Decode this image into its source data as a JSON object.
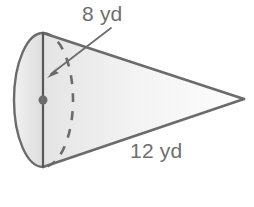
{
  "figure": {
    "name": "cone-diagram",
    "kind": "geometry-solid",
    "solid": "cone",
    "unit": "yd",
    "background_color": "#ffffff",
    "outline_color": "#6b6b6b",
    "fill_color": "#e9e9e9",
    "fill_color_light": "#fbfbfb",
    "label_color": "#6e6e6e",
    "labels": {
      "radius": "8 yd",
      "slant": "12 yd"
    },
    "measurements": [
      {
        "name": "radius",
        "value": 8,
        "unit": "yd",
        "text": "8 yd"
      },
      {
        "name": "slant-height",
        "value": 12,
        "unit": "yd",
        "text": "12 yd"
      }
    ],
    "geometry": {
      "base_center": {
        "x": 43,
        "y": 100
      },
      "base_rx": 29,
      "base_ry": 67,
      "apex": {
        "x": 244,
        "y": 99
      },
      "diameter_top": {
        "x": 43,
        "y": 33
      },
      "diameter_bottom": {
        "x": 43,
        "y": 167
      },
      "center_dot_radius": 4.5,
      "arrow_start": {
        "x": 111,
        "y": 28
      },
      "arrow_tip": {
        "x": 48,
        "y": 77
      }
    }
  }
}
